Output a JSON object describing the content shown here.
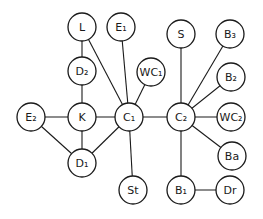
{
  "diagram": {
    "type": "graph",
    "radius": 14,
    "nodes": [
      {
        "id": "L",
        "label": "L",
        "x": 82,
        "y": 27
      },
      {
        "id": "E1",
        "label": "E₁",
        "x": 121,
        "y": 27
      },
      {
        "id": "D2",
        "label": "D₂",
        "x": 82,
        "y": 71
      },
      {
        "id": "WC1",
        "label": "WC₁",
        "x": 151,
        "y": 72
      },
      {
        "id": "S",
        "label": "S",
        "x": 181,
        "y": 34
      },
      {
        "id": "B3",
        "label": "B₃",
        "x": 230,
        "y": 34
      },
      {
        "id": "B2",
        "label": "B₂",
        "x": 231,
        "y": 77
      },
      {
        "id": "E2",
        "label": "E₂",
        "x": 31,
        "y": 117
      },
      {
        "id": "K",
        "label": "K",
        "x": 82,
        "y": 117
      },
      {
        "id": "C1",
        "label": "C₁",
        "x": 129,
        "y": 117
      },
      {
        "id": "C2",
        "label": "C₂",
        "x": 181,
        "y": 117
      },
      {
        "id": "WC2",
        "label": "WC₂",
        "x": 231,
        "y": 117
      },
      {
        "id": "Ba",
        "label": "Ba",
        "x": 232,
        "y": 156
      },
      {
        "id": "D1",
        "label": "D₁",
        "x": 82,
        "y": 163
      },
      {
        "id": "St",
        "label": "St",
        "x": 133,
        "y": 190
      },
      {
        "id": "B1",
        "label": "B₁",
        "x": 181,
        "y": 190
      },
      {
        "id": "Dr",
        "label": "Dr",
        "x": 230,
        "y": 190
      }
    ],
    "edges": [
      [
        "L",
        "D2"
      ],
      [
        "L",
        "C1"
      ],
      [
        "E1",
        "C1"
      ],
      [
        "D2",
        "K"
      ],
      [
        "WC1",
        "C1"
      ],
      [
        "E2",
        "K"
      ],
      [
        "E2",
        "D1"
      ],
      [
        "K",
        "C1"
      ],
      [
        "K",
        "D1"
      ],
      [
        "D1",
        "C1"
      ],
      [
        "C1",
        "C2"
      ],
      [
        "C1",
        "St"
      ],
      [
        "S",
        "C2"
      ],
      [
        "B3",
        "C2"
      ],
      [
        "B2",
        "C2"
      ],
      [
        "WC2",
        "C2"
      ],
      [
        "Ba",
        "C2"
      ],
      [
        "C2",
        "B1"
      ],
      [
        "B1",
        "Dr"
      ]
    ]
  }
}
